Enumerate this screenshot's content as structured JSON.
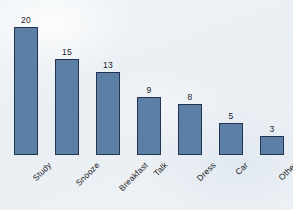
{
  "chart_data": {
    "type": "bar",
    "title": "",
    "subtitle": "",
    "xlabel": "",
    "ylabel": "",
    "categories": [
      "Study",
      "Snooze",
      "Breakfast",
      "Talk",
      "Dress",
      "Car",
      "Other"
    ],
    "values": [
      20,
      15,
      13,
      9,
      8,
      5,
      3
    ],
    "value_labels": [
      "20",
      "15",
      "13",
      "9",
      "8",
      "5",
      "3"
    ],
    "ylim": [
      0,
      20
    ],
    "grid": false,
    "legend": null,
    "axes_visible": false,
    "tick_labels_x": [
      "Study",
      "Snooze",
      "Breakfast",
      "Talk",
      "Dress",
      "Car",
      "Other"
    ],
    "tick_labels_y": [],
    "x_label_rotation_deg": -45,
    "annotations": []
  },
  "style": {
    "background_color": "#eef2f6",
    "bar_fill_color": "#5c7fa5",
    "bar_border_color": "#22344f",
    "value_label_color": "#20212a",
    "category_label_color": "#1d1f27"
  },
  "layout": {
    "baseline_y": 155,
    "bar_width": 24,
    "bar_pitch": 41,
    "first_bar_left": 14,
    "pixels_per_unit": 6.4
  }
}
